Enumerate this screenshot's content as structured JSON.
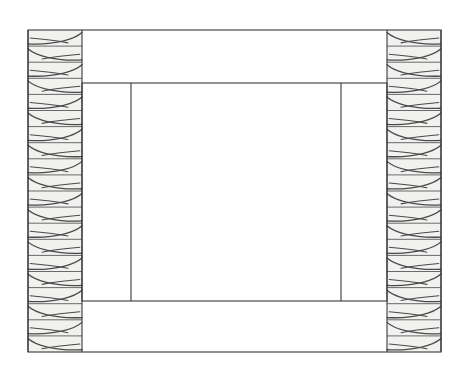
{
  "diagram": {
    "type": "technical-line-drawing",
    "canvas": {
      "width": 470,
      "height": 369,
      "background_color": "#ffffff"
    },
    "colors": {
      "stroke": "#3a3a3a",
      "hatch_stroke": "#4a4a4a",
      "hatch_fill": "#f1f1ef",
      "interior_fill": "#ffffff",
      "band_divider": "#5a5a5a"
    },
    "stroke_widths": {
      "outline": 1.1,
      "inner": 1.1,
      "hatch_band": 0.9,
      "hatch_grain": 1.3
    },
    "geometry": {
      "outer_rect": {
        "x": 28,
        "y": 30,
        "width": 413,
        "height": 322
      },
      "inner_rect": {
        "x": 82,
        "y": 83,
        "width": 305,
        "height": 218
      },
      "left_hatch_column": {
        "x": 28,
        "y": 30,
        "width": 54,
        "height": 322
      },
      "right_hatch_column": {
        "x": 387,
        "y": 30,
        "width": 54,
        "height": 322
      },
      "inner_vertical_left": {
        "x": 131,
        "y_top": 83,
        "y_bottom": 301
      },
      "inner_vertical_right": {
        "x": 341,
        "y_top": 83,
        "y_bottom": 301
      }
    },
    "hatch": {
      "band_height": 16.1,
      "band_count": 20,
      "description": "wood-grain zigzag hatch, bands mirrored left to right"
    },
    "elements": [
      {
        "name": "outer-boundary",
        "label": "Outer boundary rectangle"
      },
      {
        "name": "left-hatched-member",
        "label": "Left hatched member"
      },
      {
        "name": "right-hatched-member",
        "label": "Right hatched member"
      },
      {
        "name": "inner-boundary",
        "label": "Inner boundary rectangle"
      },
      {
        "name": "inner-divider-left",
        "label": "Left inner divider line"
      },
      {
        "name": "inner-divider-right",
        "label": "Right inner divider line"
      }
    ]
  }
}
